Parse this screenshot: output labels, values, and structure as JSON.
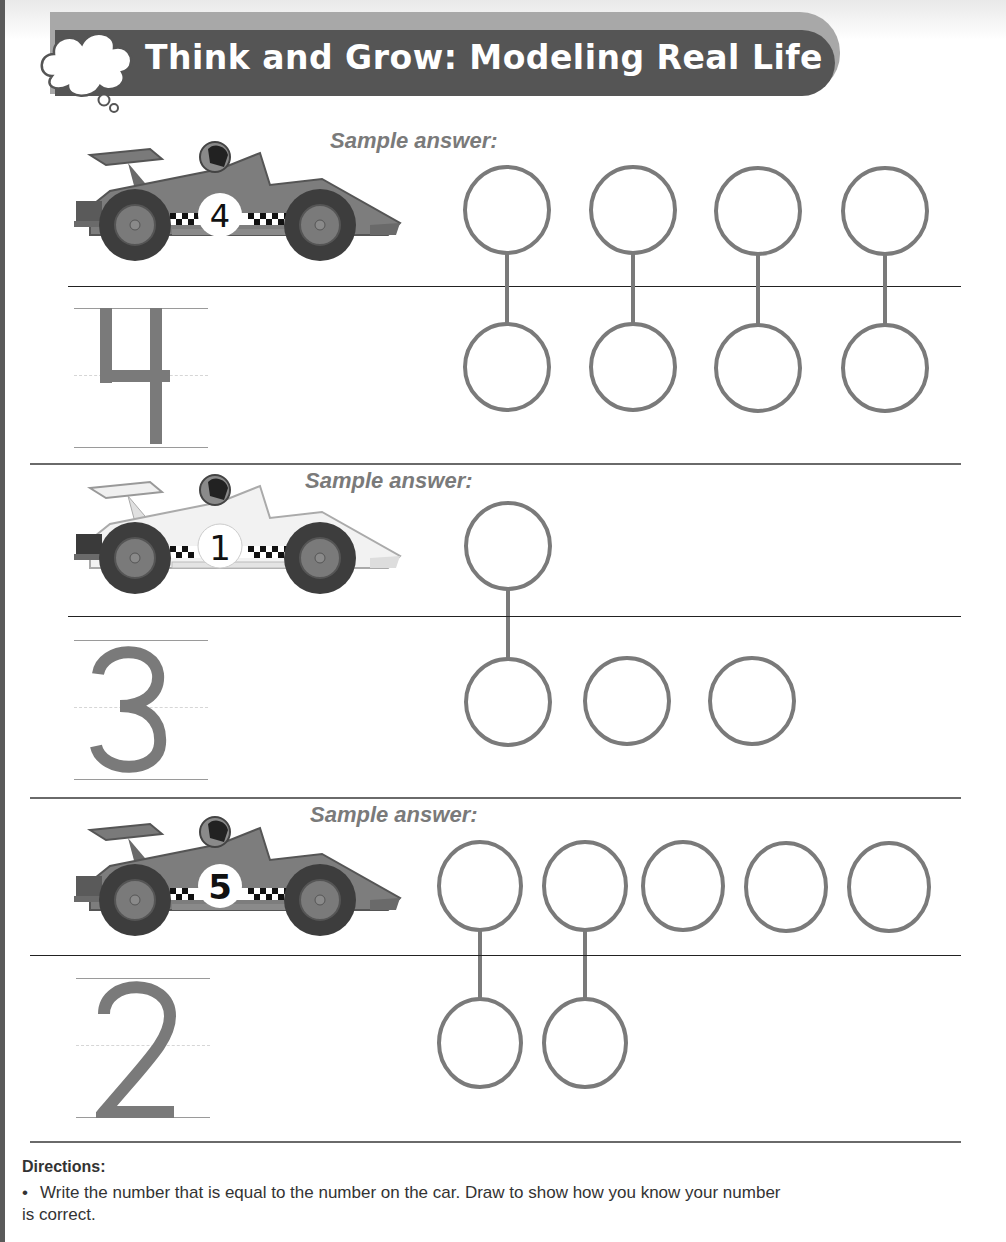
{
  "header": {
    "title": "Think and Grow: Modeling Real Life",
    "icon": "thought-cloud-icon"
  },
  "colors": {
    "title_bar": "#555555",
    "title_shadow": "#a8a8a8",
    "circle_stroke": "#7a7a7a",
    "digit_fill": "#7a7a7a",
    "text": "#333333"
  },
  "problems": [
    {
      "car_number": "4",
      "car_style": "dark",
      "sample_label": "Sample answer:",
      "written_number": "4",
      "top_circles": 4,
      "bottom_circles": 4,
      "matched_pairs": 4
    },
    {
      "car_number": "1",
      "car_style": "light",
      "sample_label": "Sample answer:",
      "written_number": "3",
      "top_circles": 1,
      "bottom_circles": 3,
      "matched_pairs": 1
    },
    {
      "car_number": "5",
      "car_style": "dark",
      "sample_label": "Sample answer:",
      "written_number": "2",
      "top_circles": 5,
      "bottom_circles": 2,
      "matched_pairs": 2
    }
  ],
  "directions": {
    "title": "Directions:",
    "items": [
      "Write the number that is equal to the number on the car. Draw to show how you know your number is correct."
    ],
    "bullet": "•"
  }
}
